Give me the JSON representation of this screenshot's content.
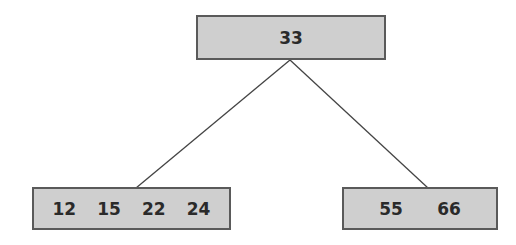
{
  "diagram": {
    "type": "b-tree",
    "root": {
      "keys": [
        "33"
      ]
    },
    "children": [
      {
        "keys": [
          "12",
          "15",
          "22",
          "24"
        ]
      },
      {
        "keys": [
          "55",
          "66"
        ]
      }
    ],
    "colors": {
      "node_fill": "#cfcfcf",
      "node_border": "#5a5a5a",
      "edge": "#444444",
      "text": "#2a2a2a"
    }
  }
}
